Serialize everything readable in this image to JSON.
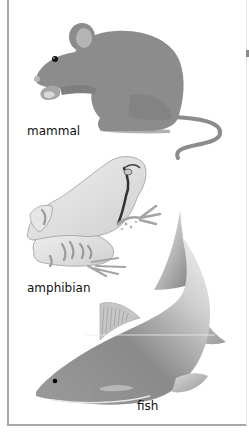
{
  "figure": {
    "panels": [
      {
        "id": "mammal",
        "label": "mammal",
        "animal": "mouse"
      },
      {
        "id": "amphibian",
        "label": "amphibian",
        "animal": "frog"
      },
      {
        "id": "fish",
        "label": "fish",
        "animal": "fish"
      }
    ]
  },
  "colors": {
    "mouse_body": "#8c8c8c",
    "mouse_ear_inner": "#b5b5b5",
    "frog_body": "#e4e4e4",
    "frog_stripe": "#9a9a9a",
    "fish_body_dark": "#8e8e8e",
    "fish_body_light": "#e8e8e8",
    "border": "#a8a8a8",
    "text": "#111111"
  }
}
